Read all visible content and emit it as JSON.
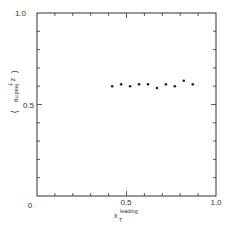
{
  "chart_data": {
    "type": "scatter",
    "title": "",
    "xlabel": "x_T^leading",
    "ylabel": "<z_T^leading>",
    "xlim": [
      0,
      1.0
    ],
    "ylim": [
      0,
      1.0
    ],
    "x_tick_labels": [
      "0",
      "0.5",
      "1.0"
    ],
    "y_tick_labels": [
      "0.5",
      "1.0"
    ],
    "minor_tick_step": 0.1,
    "grid": false,
    "legend": null,
    "series": [
      {
        "name": "data",
        "x": [
          0.42,
          0.47,
          0.52,
          0.57,
          0.62,
          0.67,
          0.72,
          0.77,
          0.82,
          0.87
        ],
        "y": [
          0.6,
          0.61,
          0.6,
          0.61,
          0.61,
          0.59,
          0.61,
          0.6,
          0.63,
          0.61
        ]
      }
    ]
  },
  "labels": {
    "x_axis_main": "x",
    "x_axis_sub": "T",
    "x_axis_sup": "leading",
    "y_axis_main": "z",
    "y_axis_sub": "T",
    "y_axis_sup": "leading",
    "x0": "0",
    "x05": "0.5",
    "x1": "1.0",
    "y05": "0.5",
    "y1": "1.0"
  },
  "colors": {
    "axis": "#333333",
    "marker": "#222222"
  }
}
